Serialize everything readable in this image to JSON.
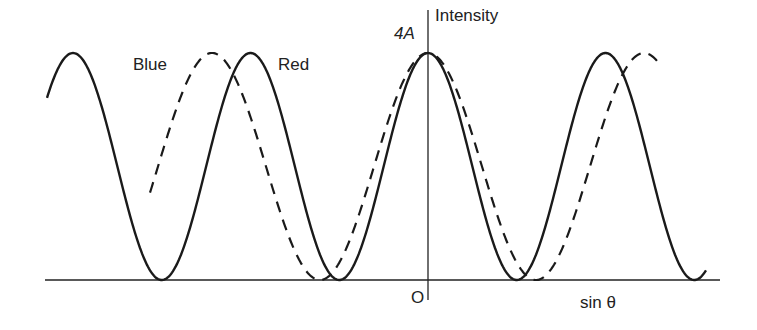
{
  "labels": {
    "y_axis": "Intensity",
    "peak_value": "4A",
    "origin": "O",
    "x_axis": "sin θ",
    "blue_curve": "Blue",
    "red_curve": "Red"
  },
  "chart_data": {
    "type": "line",
    "title": "",
    "xlabel": "sin θ",
    "ylabel": "Intensity",
    "y_tick_labels": [
      "4A"
    ],
    "origin_label": "O",
    "grid": false,
    "legend": "inline labels",
    "series": [
      {
        "name": "Red",
        "style": "solid",
        "form": "cos^2 fringe pattern",
        "peak": "4A",
        "peak_x_px": [
          73,
          250,
          428,
          605
        ],
        "min_x_px": [
          162,
          339,
          517,
          694
        ]
      },
      {
        "name": "Blue",
        "style": "dashed",
        "form": "cos^2 fringe pattern (longer period)",
        "peak": "4A",
        "peak_x_px": [
          210,
          428,
          640
        ],
        "min_x_px": [
          319,
          537
        ]
      }
    ],
    "colors": {
      "line": "#1a1a1a",
      "background": "#ffffff"
    }
  }
}
